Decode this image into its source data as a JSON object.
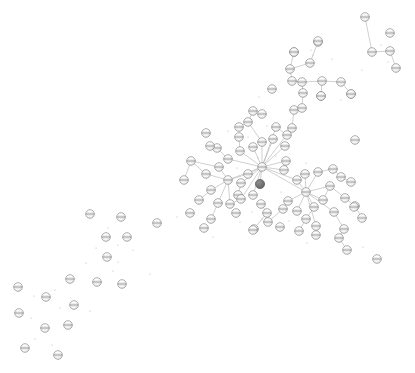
{
  "figure": {
    "title": "",
    "background_color": "#ffffff",
    "width": 415,
    "height": 373
  },
  "style": {
    "node_fill": "#fdfdfd",
    "node_stroke": "#8a8a8a",
    "node_stroke_width": 0.7,
    "node_radius": 4.3,
    "node_band_color": "#6e6e6e",
    "node_shade_color": "#d8d8d8",
    "highlight_fill": "#6f6f6f",
    "highlight_stroke": "#5a5a5a",
    "highlight_radius": 4.6,
    "edge_color": "#a9a9a9",
    "edge_width": 0.55,
    "speck_color": "#b5b5b5"
  },
  "chart_data": {
    "type": "scatter",
    "subtype": "node-link-network-graph",
    "title": "",
    "xlabel": "",
    "ylabel": "",
    "grid": false,
    "legend": null,
    "axes_visible": false,
    "xlim": [
      0,
      415
    ],
    "ylim": [
      0,
      373
    ],
    "node_count": 112,
    "edge_count": 79,
    "highlighted_node_ids": [
      59
    ],
    "hub_node_ids": [
      0,
      1,
      2,
      30
    ],
    "nodes": [
      {
        "id": 0,
        "x": 262,
        "y": 167,
        "kind": "hub"
      },
      {
        "id": 1,
        "x": 306,
        "y": 192,
        "kind": "hub"
      },
      {
        "id": 2,
        "x": 228,
        "y": 180,
        "kind": "hub"
      },
      {
        "id": 3,
        "x": 240,
        "y": 151,
        "kind": "normal"
      },
      {
        "id": 4,
        "x": 253,
        "y": 147,
        "kind": "normal"
      },
      {
        "id": 5,
        "x": 262,
        "y": 142,
        "kind": "normal"
      },
      {
        "id": 6,
        "x": 239,
        "y": 137,
        "kind": "normal"
      },
      {
        "id": 7,
        "x": 228,
        "y": 159,
        "kind": "normal"
      },
      {
        "id": 8,
        "x": 217,
        "y": 148,
        "kind": "normal"
      },
      {
        "id": 9,
        "x": 248,
        "y": 122,
        "kind": "normal"
      },
      {
        "id": 10,
        "x": 239,
        "y": 127,
        "kind": "normal"
      },
      {
        "id": 11,
        "x": 253,
        "y": 111,
        "kind": "normal"
      },
      {
        "id": 12,
        "x": 273,
        "y": 139,
        "kind": "normal"
      },
      {
        "id": 13,
        "x": 285,
        "y": 146,
        "kind": "normal"
      },
      {
        "id": 14,
        "x": 276,
        "y": 127,
        "kind": "normal"
      },
      {
        "id": 15,
        "x": 287,
        "y": 135,
        "kind": "normal"
      },
      {
        "id": 16,
        "x": 292,
        "y": 128,
        "kind": "normal"
      },
      {
        "id": 17,
        "x": 294,
        "y": 110,
        "kind": "normal"
      },
      {
        "id": 18,
        "x": 302,
        "y": 108,
        "kind": "normal"
      },
      {
        "id": 19,
        "x": 303,
        "y": 93,
        "kind": "normal"
      },
      {
        "id": 20,
        "x": 302,
        "y": 82,
        "kind": "normal"
      },
      {
        "id": 21,
        "x": 292,
        "y": 81,
        "kind": "normal"
      },
      {
        "id": 22,
        "x": 290,
        "y": 69,
        "kind": "normal"
      },
      {
        "id": 23,
        "x": 294,
        "y": 52,
        "kind": "normal"
      },
      {
        "id": 24,
        "x": 310,
        "y": 63,
        "kind": "normal"
      },
      {
        "id": 25,
        "x": 318,
        "y": 42,
        "kind": "normal"
      },
      {
        "id": 26,
        "x": 322,
        "y": 81,
        "kind": "normal"
      },
      {
        "id": 27,
        "x": 341,
        "y": 82,
        "kind": "normal"
      },
      {
        "id": 28,
        "x": 321,
        "y": 96,
        "kind": "normal"
      },
      {
        "id": 29,
        "x": 351,
        "y": 94,
        "kind": "normal"
      },
      {
        "id": 30,
        "x": 284,
        "y": 170,
        "kind": "normal"
      },
      {
        "id": 31,
        "x": 286,
        "y": 161,
        "kind": "normal"
      },
      {
        "id": 32,
        "x": 248,
        "y": 174,
        "kind": "normal"
      },
      {
        "id": 33,
        "x": 241,
        "y": 183,
        "kind": "normal"
      },
      {
        "id": 34,
        "x": 238,
        "y": 195,
        "kind": "normal"
      },
      {
        "id": 35,
        "x": 219,
        "y": 167,
        "kind": "normal"
      },
      {
        "id": 36,
        "x": 206,
        "y": 174,
        "kind": "normal"
      },
      {
        "id": 37,
        "x": 191,
        "y": 161,
        "kind": "normal"
      },
      {
        "id": 38,
        "x": 184,
        "y": 180,
        "kind": "normal"
      },
      {
        "id": 39,
        "x": 211,
        "y": 190,
        "kind": "normal"
      },
      {
        "id": 40,
        "x": 199,
        "y": 200,
        "kind": "normal"
      },
      {
        "id": 41,
        "x": 218,
        "y": 203,
        "kind": "normal"
      },
      {
        "id": 42,
        "x": 211,
        "y": 219,
        "kind": "normal"
      },
      {
        "id": 43,
        "x": 230,
        "y": 204,
        "kind": "normal"
      },
      {
        "id": 44,
        "x": 241,
        "y": 199,
        "kind": "normal"
      },
      {
        "id": 45,
        "x": 261,
        "y": 204,
        "kind": "normal"
      },
      {
        "id": 46,
        "x": 267,
        "y": 213,
        "kind": "normal"
      },
      {
        "id": 47,
        "x": 254,
        "y": 229,
        "kind": "normal"
      },
      {
        "id": 48,
        "x": 283,
        "y": 209,
        "kind": "normal"
      },
      {
        "id": 49,
        "x": 268,
        "y": 222,
        "kind": "normal"
      },
      {
        "id": 50,
        "x": 253,
        "y": 195,
        "kind": "normal"
      },
      {
        "id": 51,
        "x": 288,
        "y": 201,
        "kind": "normal"
      },
      {
        "id": 52,
        "x": 297,
        "y": 180,
        "kind": "normal"
      },
      {
        "id": 53,
        "x": 305,
        "y": 174,
        "kind": "normal"
      },
      {
        "id": 54,
        "x": 318,
        "y": 172,
        "kind": "normal"
      },
      {
        "id": 55,
        "x": 333,
        "y": 169,
        "kind": "normal"
      },
      {
        "id": 56,
        "x": 341,
        "y": 177,
        "kind": "normal"
      },
      {
        "id": 57,
        "x": 351,
        "y": 182,
        "kind": "normal"
      },
      {
        "id": 58,
        "x": 330,
        "y": 186,
        "kind": "normal"
      },
      {
        "id": 59,
        "x": 260,
        "y": 184,
        "kind": "highlight"
      },
      {
        "id": 60,
        "x": 345,
        "y": 198,
        "kind": "normal"
      },
      {
        "id": 61,
        "x": 323,
        "y": 200,
        "kind": "normal"
      },
      {
        "id": 62,
        "x": 314,
        "y": 207,
        "kind": "normal"
      },
      {
        "id": 63,
        "x": 297,
        "y": 211,
        "kind": "normal"
      },
      {
        "id": 64,
        "x": 306,
        "y": 219,
        "kind": "normal"
      },
      {
        "id": 65,
        "x": 316,
        "y": 226,
        "kind": "normal"
      },
      {
        "id": 66,
        "x": 334,
        "y": 212,
        "kind": "normal"
      },
      {
        "id": 67,
        "x": 355,
        "y": 206,
        "kind": "normal"
      },
      {
        "id": 68,
        "x": 362,
        "y": 218,
        "kind": "normal"
      },
      {
        "id": 69,
        "x": 344,
        "y": 229,
        "kind": "normal"
      },
      {
        "id": 70,
        "x": 299,
        "y": 231,
        "kind": "normal"
      },
      {
        "id": 71,
        "x": 316,
        "y": 235,
        "kind": "normal"
      },
      {
        "id": 72,
        "x": 339,
        "y": 238,
        "kind": "normal"
      },
      {
        "id": 73,
        "x": 347,
        "y": 250,
        "kind": "normal"
      },
      {
        "id": 74,
        "x": 377,
        "y": 259,
        "kind": "normal"
      },
      {
        "id": 75,
        "x": 365,
        "y": 17,
        "kind": "normal"
      },
      {
        "id": 76,
        "x": 390,
        "y": 33,
        "kind": "normal"
      },
      {
        "id": 77,
        "x": 372,
        "y": 52,
        "kind": "normal"
      },
      {
        "id": 78,
        "x": 390,
        "y": 51,
        "kind": "normal"
      },
      {
        "id": 79,
        "x": 396,
        "y": 68,
        "kind": "normal"
      },
      {
        "id": 80,
        "x": 318,
        "y": 41,
        "kind": "normal"
      },
      {
        "id": 81,
        "x": 351,
        "y": 94,
        "kind": "normal"
      },
      {
        "id": 82,
        "x": 90,
        "y": 214,
        "kind": "isolated"
      },
      {
        "id": 83,
        "x": 121,
        "y": 217,
        "kind": "isolated"
      },
      {
        "id": 84,
        "x": 157,
        "y": 223,
        "kind": "isolated"
      },
      {
        "id": 85,
        "x": 106,
        "y": 237,
        "kind": "isolated"
      },
      {
        "id": 86,
        "x": 127,
        "y": 237,
        "kind": "isolated"
      },
      {
        "id": 87,
        "x": 107,
        "y": 257,
        "kind": "isolated"
      },
      {
        "id": 88,
        "x": 70,
        "y": 279,
        "kind": "isolated"
      },
      {
        "id": 89,
        "x": 97,
        "y": 282,
        "kind": "isolated"
      },
      {
        "id": 90,
        "x": 122,
        "y": 284,
        "kind": "isolated"
      },
      {
        "id": 91,
        "x": 18,
        "y": 287,
        "kind": "isolated"
      },
      {
        "id": 92,
        "x": 46,
        "y": 297,
        "kind": "isolated"
      },
      {
        "id": 93,
        "x": 74,
        "y": 305,
        "kind": "isolated"
      },
      {
        "id": 94,
        "x": 19,
        "y": 313,
        "kind": "isolated"
      },
      {
        "id": 95,
        "x": 45,
        "y": 328,
        "kind": "isolated"
      },
      {
        "id": 96,
        "x": 68,
        "y": 325,
        "kind": "isolated"
      },
      {
        "id": 97,
        "x": 25,
        "y": 348,
        "kind": "isolated"
      },
      {
        "id": 98,
        "x": 58,
        "y": 355,
        "kind": "isolated"
      },
      {
        "id": 99,
        "x": 210,
        "y": 146,
        "kind": "isolated"
      },
      {
        "id": 100,
        "x": 262,
        "y": 114,
        "kind": "isolated"
      },
      {
        "id": 101,
        "x": 321,
        "y": 96,
        "kind": "isolated"
      },
      {
        "id": 102,
        "x": 280,
        "y": 227,
        "kind": "isolated"
      },
      {
        "id": 103,
        "x": 253,
        "y": 230,
        "kind": "isolated"
      },
      {
        "id": 104,
        "x": 190,
        "y": 213,
        "kind": "isolated"
      },
      {
        "id": 105,
        "x": 236,
        "y": 213,
        "kind": "isolated"
      },
      {
        "id": 106,
        "x": 204,
        "y": 228,
        "kind": "isolated"
      },
      {
        "id": 107,
        "x": 355,
        "y": 140,
        "kind": "isolated"
      },
      {
        "id": 108,
        "x": 272,
        "y": 89,
        "kind": "isolated"
      },
      {
        "id": 109,
        "x": 206,
        "y": 133,
        "kind": "isolated"
      },
      {
        "id": 110,
        "x": 294,
        "y": 52,
        "kind": "isolated"
      },
      {
        "id": 111,
        "x": 354,
        "y": 207,
        "kind": "isolated"
      }
    ],
    "edges": [
      [
        0,
        3
      ],
      [
        0,
        4
      ],
      [
        0,
        5
      ],
      [
        0,
        7
      ],
      [
        0,
        12
      ],
      [
        0,
        13
      ],
      [
        0,
        14
      ],
      [
        0,
        30
      ],
      [
        0,
        31
      ],
      [
        0,
        32
      ],
      [
        0,
        33
      ],
      [
        0,
        44
      ],
      [
        0,
        50
      ],
      [
        0,
        59
      ],
      [
        0,
        16
      ],
      [
        0,
        52
      ],
      [
        0,
        1
      ],
      [
        0,
        2
      ],
      [
        3,
        6
      ],
      [
        7,
        8
      ],
      [
        5,
        9
      ],
      [
        9,
        10
      ],
      [
        9,
        11
      ],
      [
        14,
        15
      ],
      [
        15,
        16
      ],
      [
        16,
        17
      ],
      [
        17,
        18
      ],
      [
        18,
        19
      ],
      [
        19,
        20
      ],
      [
        20,
        21
      ],
      [
        21,
        22
      ],
      [
        22,
        23
      ],
      [
        22,
        24
      ],
      [
        24,
        25
      ],
      [
        20,
        26
      ],
      [
        26,
        27
      ],
      [
        26,
        28
      ],
      [
        27,
        29
      ],
      [
        2,
        35
      ],
      [
        2,
        36
      ],
      [
        2,
        39
      ],
      [
        2,
        41
      ],
      [
        2,
        43
      ],
      [
        2,
        32
      ],
      [
        35,
        37
      ],
      [
        36,
        37
      ],
      [
        37,
        38
      ],
      [
        39,
        40
      ],
      [
        41,
        42
      ],
      [
        43,
        44
      ],
      [
        33,
        34
      ],
      [
        45,
        46
      ],
      [
        46,
        47
      ],
      [
        48,
        49
      ],
      [
        1,
        52
      ],
      [
        1,
        53
      ],
      [
        1,
        54
      ],
      [
        1,
        58
      ],
      [
        1,
        61
      ],
      [
        1,
        62
      ],
      [
        1,
        63
      ],
      [
        1,
        51
      ],
      [
        1,
        65
      ],
      [
        1,
        66
      ],
      [
        54,
        55
      ],
      [
        55,
        56
      ],
      [
        56,
        57
      ],
      [
        58,
        60
      ],
      [
        60,
        67
      ],
      [
        67,
        68
      ],
      [
        62,
        64
      ],
      [
        64,
        70
      ],
      [
        65,
        71
      ],
      [
        66,
        69
      ],
      [
        69,
        72
      ],
      [
        72,
        73
      ],
      [
        53,
        52
      ],
      [
        61,
        58
      ],
      [
        51,
        48
      ],
      [
        75,
        77
      ],
      [
        77,
        78
      ],
      [
        78,
        79
      ]
    ],
    "specks": [
      {
        "x": 228,
        "y": 131
      },
      {
        "x": 248,
        "y": 137
      },
      {
        "x": 267,
        "y": 126
      },
      {
        "x": 258,
        "y": 158
      },
      {
        "x": 276,
        "y": 156
      },
      {
        "x": 311,
        "y": 50
      },
      {
        "x": 313,
        "y": 55
      },
      {
        "x": 332,
        "y": 59
      },
      {
        "x": 381,
        "y": 45
      },
      {
        "x": 388,
        "y": 62
      },
      {
        "x": 362,
        "y": 70
      },
      {
        "x": 341,
        "y": 100
      },
      {
        "x": 252,
        "y": 212
      },
      {
        "x": 262,
        "y": 219
      },
      {
        "x": 289,
        "y": 221
      },
      {
        "x": 281,
        "y": 192
      },
      {
        "x": 240,
        "y": 222
      },
      {
        "x": 213,
        "y": 237
      },
      {
        "x": 177,
        "y": 217
      },
      {
        "x": 108,
        "y": 228
      },
      {
        "x": 118,
        "y": 245
      },
      {
        "x": 133,
        "y": 250
      },
      {
        "x": 96,
        "y": 248
      },
      {
        "x": 86,
        "y": 263
      },
      {
        "x": 118,
        "y": 262
      },
      {
        "x": 55,
        "y": 290
      },
      {
        "x": 34,
        "y": 296
      },
      {
        "x": 60,
        "y": 308
      },
      {
        "x": 31,
        "y": 318
      },
      {
        "x": 90,
        "y": 311
      },
      {
        "x": 35,
        "y": 339
      },
      {
        "x": 52,
        "y": 345
      },
      {
        "x": 150,
        "y": 274
      },
      {
        "x": 113,
        "y": 271
      },
      {
        "x": 340,
        "y": 236
      },
      {
        "x": 363,
        "y": 247
      },
      {
        "x": 307,
        "y": 243
      },
      {
        "x": 259,
        "y": 97
      },
      {
        "x": 237,
        "y": 168
      },
      {
        "x": 306,
        "y": 163
      }
    ]
  }
}
